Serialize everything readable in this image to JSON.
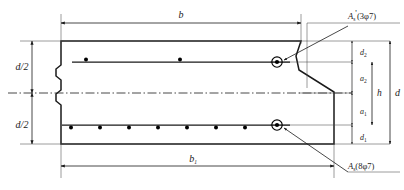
{
  "figure": {
    "kind": "engineering-cross-section-drawing",
    "line_color": "#1a1a1a",
    "fill_color": "#ffffff",
    "rebar_dot_color": "#000000"
  },
  "dimensions": {
    "top_width": {
      "label": "b",
      "subscript": ""
    },
    "bottom_width": {
      "label": "b",
      "subscript": "1"
    },
    "total_depth": {
      "label": "d",
      "subscript": ""
    },
    "upper_half_depth": {
      "label": "d/2",
      "subscript": ""
    },
    "lower_half_depth": {
      "label": "d/2",
      "subscript": ""
    },
    "effective_depth": {
      "label": "h",
      "subscript": ""
    },
    "top_cover": {
      "label": "d",
      "subscript": "2"
    },
    "bottom_cover": {
      "label": "d",
      "subscript": "1"
    },
    "upper_lever_arm": {
      "label": "a",
      "subscript": "2"
    },
    "lower_lever_arm": {
      "label": "a",
      "subscript": "1"
    }
  },
  "reinforcement": {
    "top": {
      "symbol": "A",
      "symbol_subscript": "s",
      "symbol_prime": "'",
      "spec": "(3φ7)",
      "bar_count": 3,
      "bar_diameter": "φ7"
    },
    "bottom": {
      "symbol": "A",
      "symbol_subscript": "s",
      "symbol_prime": "",
      "spec": "(8φ7)",
      "bar_count": 8,
      "bar_diameter": "φ7"
    }
  },
  "rebar_positions": {
    "top_row_y": 62,
    "bottom_row_y": 125,
    "top_row_x": [
      86,
      180,
      277
    ],
    "bottom_row_x": [
      71,
      100,
      129,
      158,
      187,
      216,
      245,
      277
    ],
    "top_callout_marker_x": 277,
    "bottom_callout_marker_x": 277
  },
  "geometry": {
    "outline_left_x": 61,
    "outline_top_y": 41,
    "outline_bottom_y": 144,
    "outline_right_top_x": 301,
    "outline_right_bottom_x": 334,
    "centerline_y": 93,
    "break_symbol_x": 61
  },
  "centerline": {
    "style": "dash-dot",
    "name": "axis-centerline"
  }
}
